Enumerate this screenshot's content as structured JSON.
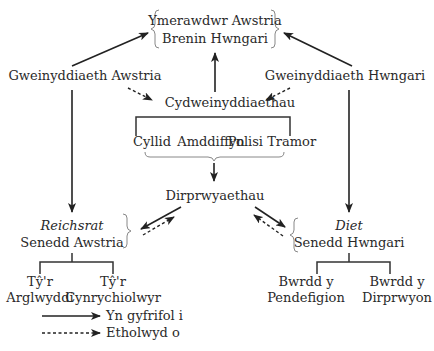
{
  "diagram": {
    "emperor": {
      "line1": "Ymerawdwr Awstria",
      "line2": "Brenin Hwngari"
    },
    "ministry_austria": "Gweinyddiaeth Awstria",
    "ministry_hungary": "Gweinyddiaeth Hwngari",
    "joint_ministry": "Cydweinyddiaethau",
    "joint_ministries": [
      "Cyllid",
      "Amddiffyn",
      "Polisi Tramor"
    ],
    "delegations": "Dirprwyaethau",
    "austria_parliament": {
      "name": "Reichsrat",
      "label": "Senedd Awstria"
    },
    "hungary_parliament": {
      "name": "Diet",
      "label": "Senedd Hwngari"
    },
    "austria_houses": [
      {
        "line1": "Tŷ'r",
        "line2": "Arglwyddi"
      },
      {
        "line1": "Tŷ'r",
        "line2": "Cynrychiolwyr"
      }
    ],
    "hungary_houses": [
      {
        "line1": "Bwrdd y",
        "line2": "Pendefigion"
      },
      {
        "line1": "Bwrdd y",
        "line2": "Dirprwyon"
      }
    ]
  },
  "legend": {
    "solid": "Yn gyfrifol i",
    "dashed": "Etholwyd o"
  }
}
